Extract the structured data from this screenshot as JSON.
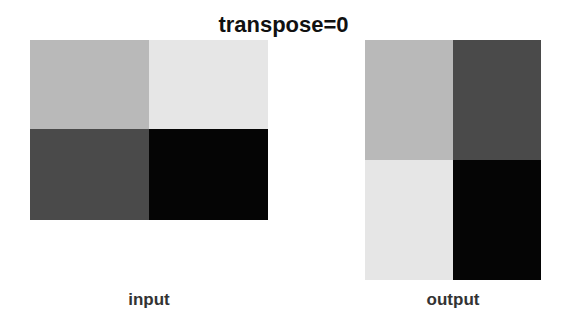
{
  "title": "transpose=0",
  "panels": {
    "input": {
      "label": "input",
      "rows": 2,
      "cols": 2,
      "cells": [
        "#b9b9b9",
        "#e6e6e6",
        "#4a4a4a",
        "#050505"
      ]
    },
    "output": {
      "label": "output",
      "rows": 2,
      "cols": 2,
      "cells": [
        "#b9b9b9",
        "#4a4a4a",
        "#e6e6e6",
        "#050505"
      ]
    }
  }
}
